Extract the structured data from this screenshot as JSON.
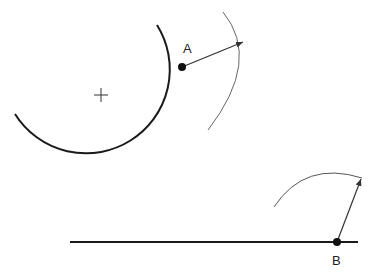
{
  "diagram": {
    "colors": {
      "stroke": "#1a1a1a",
      "thin": "#555555",
      "background": "#ffffff"
    },
    "circle": {
      "center": [
        101,
        96
      ],
      "radius": 82,
      "center_mark": "+"
    },
    "points": [
      {
        "id": "A",
        "label": "A",
        "x": 182,
        "y": 67
      },
      {
        "id": "B",
        "label": "B",
        "x": 337,
        "y": 242
      }
    ],
    "line": {
      "x1": 70,
      "y1": 242,
      "x2": 358,
      "y2": 242
    }
  }
}
